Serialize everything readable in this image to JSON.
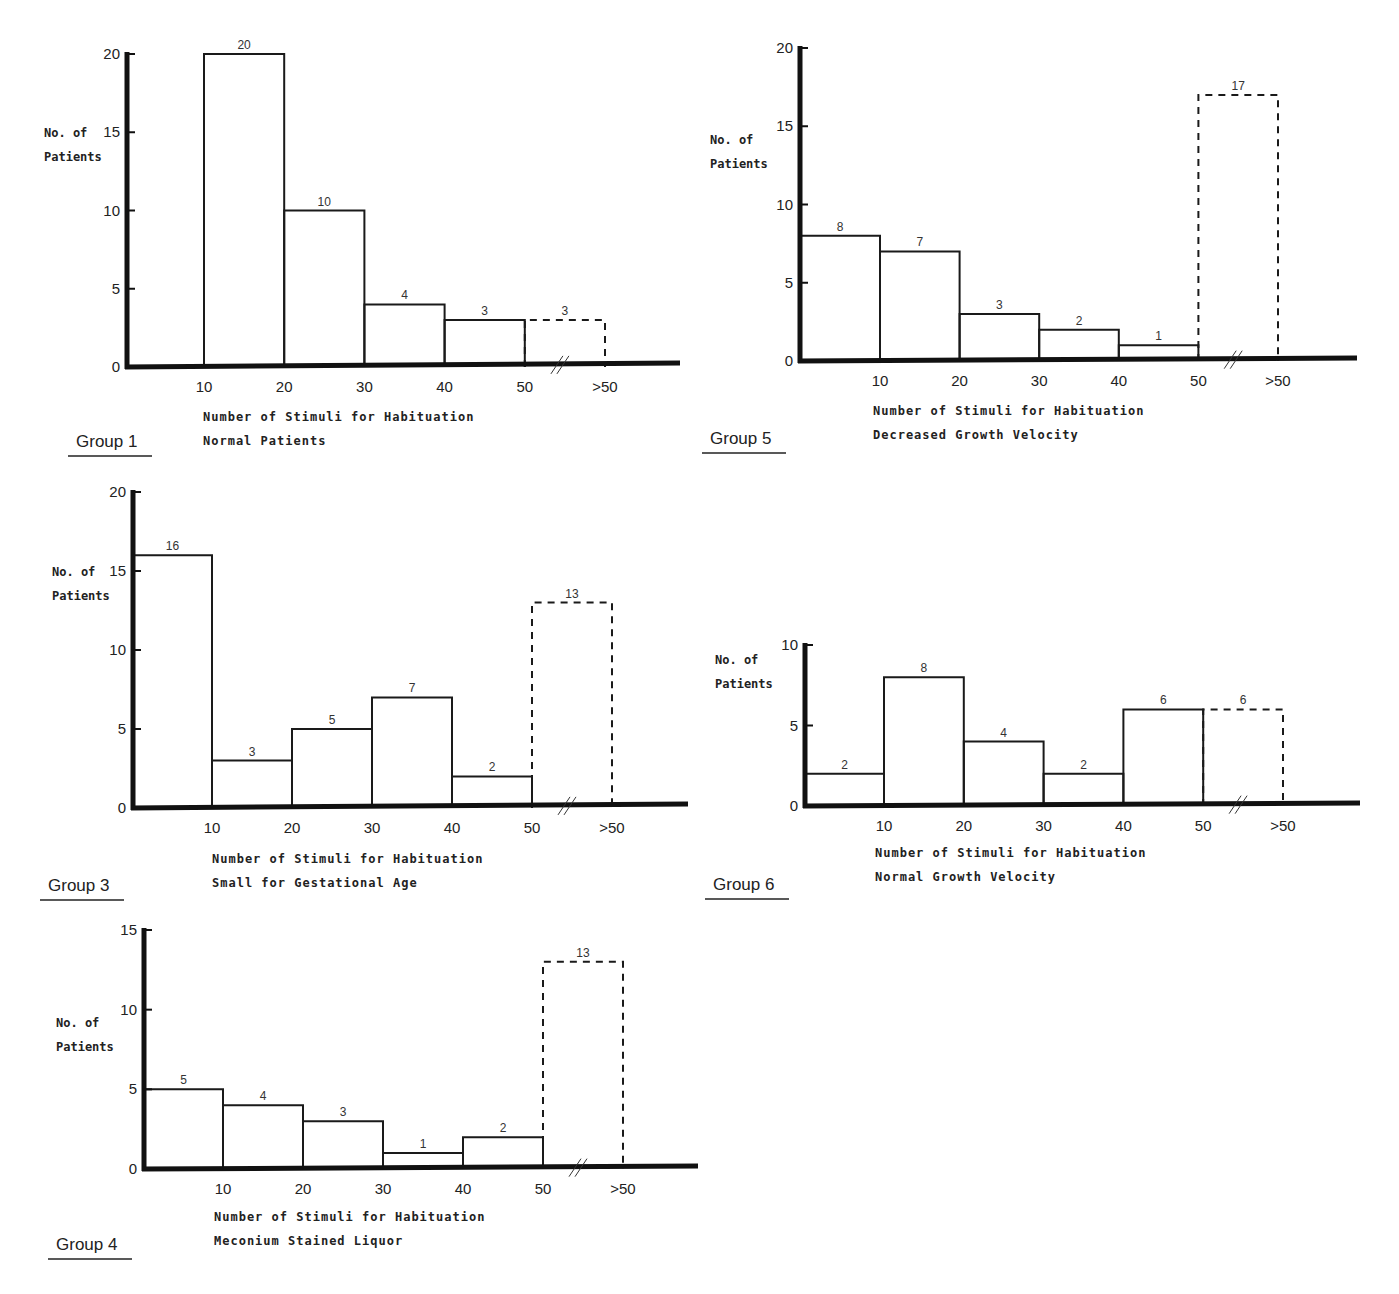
{
  "chart_data": [
    {
      "id": "group1",
      "type": "bar",
      "title": "Group 1",
      "subtitle": "Normal Patients",
      "xlabel": "Number of Stimuli for Habituation",
      "ylabel": [
        "No. of",
        "Patients"
      ],
      "categories": [
        "0-10",
        "10-20",
        "20-30",
        "30-40",
        "40-50",
        ">50"
      ],
      "values": [
        0,
        20,
        10,
        4,
        3,
        3
      ],
      "dashed": [
        false,
        false,
        false,
        false,
        false,
        true
      ],
      "bar_labels": [
        "",
        "20",
        "10",
        "4",
        "3",
        "3"
      ],
      "x_ticks": [
        "10",
        "20",
        "30",
        "40",
        "50",
        ">50"
      ],
      "y_ticks": [
        "0",
        "5",
        "10",
        "15",
        "20"
      ],
      "ylim": [
        0,
        20
      ],
      "grid": false,
      "axis_break": "//",
      "layout": {
        "ax": 127,
        "y0": 367,
        "yTop": 54,
        "ymax": 20,
        "x0": 127,
        "x10": 204,
        "step": 80.2,
        "xEnd": 680,
        "tilt": -4,
        "ticksStep": 5,
        "ylx": 44,
        "yly": 137,
        "xlx": 203,
        "xly": 421,
        "gx": 76,
        "gy": 447
      }
    },
    {
      "id": "group5",
      "type": "bar",
      "title": "Group 5",
      "subtitle": "Decreased Growth Velocity",
      "xlabel": "Number of Stimuli for Habituation",
      "ylabel": [
        "No. of",
        "Patients"
      ],
      "categories": [
        "0-10",
        "10-20",
        "20-30",
        "30-40",
        "40-50",
        ">50"
      ],
      "values": [
        8,
        7,
        3,
        2,
        1,
        17
      ],
      "dashed": [
        false,
        false,
        false,
        false,
        false,
        true
      ],
      "bar_labels": [
        "8",
        "7",
        "3",
        "2",
        "1",
        "17"
      ],
      "x_ticks": [
        "10",
        "20",
        "30",
        "40",
        "50",
        ">50"
      ],
      "y_ticks": [
        "0",
        "5",
        "10",
        "15",
        "20"
      ],
      "ylim": [
        0,
        20
      ],
      "grid": false,
      "axis_break": "//",
      "layout": {
        "ax": 800,
        "y0": 361,
        "yTop": 48,
        "ymax": 20,
        "x0": 800,
        "x10": 880,
        "step": 79.6,
        "xEnd": 1357,
        "tilt": -3,
        "ticksStep": 5,
        "ylx": 710,
        "yly": 144,
        "xlx": 873,
        "xly": 415,
        "gx": 710,
        "gy": 444
      }
    },
    {
      "id": "group3",
      "type": "bar",
      "title": "Group 3",
      "subtitle": "Small for Gestational Age",
      "xlabel": "Number of Stimuli for Habituation",
      "ylabel": [
        "No. of",
        "Patients"
      ],
      "categories": [
        "0-10",
        "10-20",
        "20-30",
        "30-40",
        "40-50",
        ">50"
      ],
      "values": [
        16,
        3,
        5,
        7,
        2,
        13
      ],
      "dashed": [
        false,
        false,
        false,
        false,
        false,
        true
      ],
      "bar_labels": [
        "16",
        "3",
        "5",
        "7",
        "2",
        "13"
      ],
      "x_ticks": [
        "10",
        "20",
        "30",
        "40",
        "50",
        ">50"
      ],
      "y_ticks": [
        "0",
        "5",
        "10",
        "15",
        "20"
      ],
      "ylim": [
        0,
        20
      ],
      "grid": false,
      "axis_break": "//",
      "layout": {
        "ax": 133,
        "y0": 808,
        "yTop": 492,
        "ymax": 20,
        "x0": 133,
        "x10": 212,
        "step": 80,
        "xEnd": 688,
        "tilt": -4,
        "ticksStep": 5,
        "ylx": 52,
        "yly": 576,
        "xlx": 212,
        "xly": 863,
        "gx": 48,
        "gy": 891
      }
    },
    {
      "id": "group6",
      "type": "bar",
      "title": "Group 6",
      "subtitle": "Normal Growth Velocity",
      "xlabel": "Number of Stimuli for Habituation",
      "ylabel": [
        "No. of",
        "Patients"
      ],
      "categories": [
        "0-10",
        "10-20",
        "20-30",
        "30-40",
        "40-50",
        ">50"
      ],
      "values": [
        2,
        8,
        4,
        2,
        6,
        6
      ],
      "dashed": [
        false,
        false,
        false,
        false,
        false,
        true
      ],
      "bar_labels": [
        "2",
        "8",
        "4",
        "2",
        "6",
        "6"
      ],
      "x_ticks": [
        "10",
        "20",
        "30",
        "40",
        "50",
        ">50"
      ],
      "y_ticks": [
        "0",
        "5",
        "10"
      ],
      "ylim": [
        0,
        10
      ],
      "grid": false,
      "axis_break": "//",
      "layout": {
        "ax": 805,
        "y0": 806,
        "yTop": 645,
        "ymax": 10,
        "x0": 805,
        "x10": 884,
        "step": 79.8,
        "xEnd": 1360,
        "tilt": -3,
        "ticksStep": 5,
        "ylx": 715,
        "yly": 664,
        "xlx": 875,
        "xly": 857,
        "gx": 713,
        "gy": 890
      }
    },
    {
      "id": "group4",
      "type": "bar",
      "title": "Group 4",
      "subtitle": "Meconium Stained Liquor",
      "xlabel": "Number of Stimuli for Habituation",
      "ylabel": [
        "No. of",
        "Patients"
      ],
      "categories": [
        "0-10",
        "10-20",
        "20-30",
        "30-40",
        "40-50",
        ">50"
      ],
      "values": [
        5,
        4,
        3,
        1,
        2,
        13
      ],
      "dashed": [
        false,
        false,
        false,
        false,
        false,
        true
      ],
      "bar_labels": [
        "5",
        "4",
        "3",
        "1",
        "2",
        "13"
      ],
      "x_ticks": [
        "10",
        "20",
        "30",
        "40",
        "50",
        ">50"
      ],
      "y_ticks": [
        "0",
        "5",
        "10",
        "15"
      ],
      "ylim": [
        0,
        15
      ],
      "grid": false,
      "axis_break": "//",
      "layout": {
        "ax": 144,
        "y0": 1169,
        "yTop": 930,
        "ymax": 15,
        "x0": 144,
        "x10": 223,
        "step": 80,
        "xEnd": 698,
        "tilt": -3,
        "ticksStep": 5,
        "ylx": 56,
        "yly": 1027,
        "xlx": 214,
        "xly": 1221,
        "gx": 56,
        "gy": 1250
      }
    }
  ],
  "footer": {
    "clipped_text": "................................................................................"
  }
}
